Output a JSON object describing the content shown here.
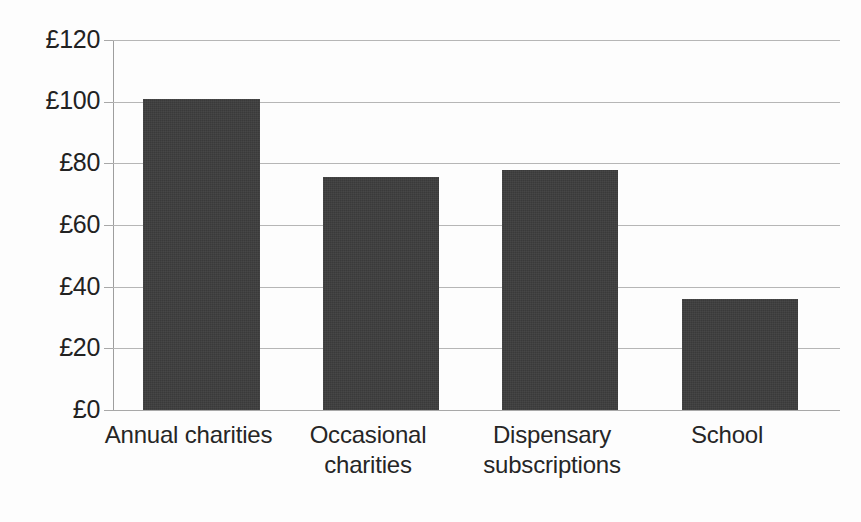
{
  "chart_data": {
    "type": "bar",
    "title": "",
    "subtitle": "",
    "xlabel": "",
    "ylabel": "",
    "categories": [
      "Annual charities",
      "Occasional charities",
      "Dispensary subscriptions",
      "School"
    ],
    "values": [
      101,
      75.5,
      78,
      36
    ],
    "ylim": [
      0,
      120
    ],
    "yticks": [
      0,
      20,
      40,
      60,
      80,
      100,
      120
    ],
    "ytick_labels": [
      "£0",
      "£20",
      "£40",
      "£60",
      "£80",
      "£100",
      "£120"
    ],
    "currency_symbol": "£",
    "grid": true,
    "legend": false,
    "legend_position": "none",
    "bar_color": "#3a3a3a",
    "gridline_color": "#b6b6b6",
    "background_color": "#fdfdfd"
  },
  "axis": {
    "y_labels": [
      {
        "text": "£120",
        "value": 120
      },
      {
        "text": "£100",
        "value": 100
      },
      {
        "text": "£80",
        "value": 80
      },
      {
        "text": "£60",
        "value": 60
      },
      {
        "text": "£40",
        "value": 40
      },
      {
        "text": "£20",
        "value": 20
      },
      {
        "text": "£0",
        "value": 0
      }
    ],
    "x_labels": [
      {
        "lines": [
          "Annual charities"
        ]
      },
      {
        "lines": [
          "Occasional",
          "charities"
        ]
      },
      {
        "lines": [
          "Dispensary",
          "subscriptions"
        ]
      },
      {
        "lines": [
          "School"
        ]
      }
    ]
  },
  "x_label_lines": {
    "cat0_line0": "Annual charities",
    "cat1_line0": "Occasional",
    "cat1_line1": "charities",
    "cat2_line0": "Dispensary",
    "cat2_line1": "subscriptions",
    "cat3_line0": "School"
  },
  "y_label_text": {
    "t120": "£120",
    "t100": "£100",
    "t80": "£80",
    "t60": "£60",
    "t40": "£40",
    "t20": "£20",
    "t0": "£0"
  }
}
